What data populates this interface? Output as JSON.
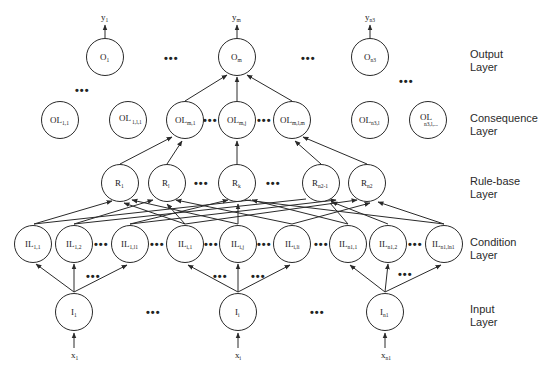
{
  "diagram": {
    "type": "fuzzy-neural-network",
    "layers": [
      {
        "id": "output",
        "label_line1": "Output",
        "label_line2": "Layer"
      },
      {
        "id": "consequence",
        "label_line1": "Consequence",
        "label_line2": "Layer"
      },
      {
        "id": "rule",
        "label_line1": "Rule-base",
        "label_line2": "Layer"
      },
      {
        "id": "condition",
        "label_line1": "Condition",
        "label_line2": "Layer"
      },
      {
        "id": "input",
        "label_line1": "Input",
        "label_line2": "Layer"
      }
    ],
    "outputs": [
      {
        "base": "y",
        "sub": "1"
      },
      {
        "base": "y",
        "sub": "m"
      },
      {
        "base": "y",
        "sub": "n3"
      }
    ],
    "output_nodes": [
      {
        "base": "O",
        "sub": "1"
      },
      {
        "base": "O",
        "sub": "m"
      },
      {
        "base": "O",
        "sub": "n3"
      }
    ],
    "consequence_nodes": [
      {
        "base": "OL",
        "sub": "1,1"
      },
      {
        "base": "OL",
        "sub": "1,l,1"
      },
      {
        "base": "OL",
        "sub": "m,1"
      },
      {
        "base": "OL",
        "sub": "m,j"
      },
      {
        "base": "OL",
        "sub": "m,l,m"
      },
      {
        "base": "OL",
        "sub": "n3,l"
      },
      {
        "base": "OL",
        "sub": "n3,l,..."
      }
    ],
    "rule_nodes": [
      {
        "base": "R",
        "sub": "1"
      },
      {
        "base": "R",
        "sub": "l"
      },
      {
        "base": "R",
        "sub": "k"
      },
      {
        "base": "R",
        "sub": "n2-1"
      },
      {
        "base": "R",
        "sub": "n2"
      }
    ],
    "condition_nodes": [
      {
        "base": "IL",
        "sub": "1,1"
      },
      {
        "base": "IL",
        "sub": "1,2"
      },
      {
        "base": "IL",
        "sub": "1,l1"
      },
      {
        "base": "IL",
        "sub": "i,1"
      },
      {
        "base": "IL",
        "sub": "i,j"
      },
      {
        "base": "IL",
        "sub": "i,li"
      },
      {
        "base": "IL",
        "sub": "n1,1"
      },
      {
        "base": "IL",
        "sub": "n1,2"
      },
      {
        "base": "IL",
        "sub": "n1,ln1"
      }
    ],
    "input_nodes": [
      {
        "base": "I",
        "sub": "1"
      },
      {
        "base": "I",
        "sub": "i"
      },
      {
        "base": "I",
        "sub": "n1"
      }
    ],
    "inputs": [
      {
        "base": "x",
        "sub": "1"
      },
      {
        "base": "x",
        "sub": "i"
      },
      {
        "base": "x",
        "sub": "n1"
      }
    ],
    "ellipsis": "•••"
  }
}
